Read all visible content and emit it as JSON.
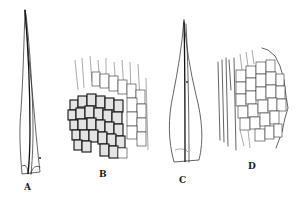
{
  "figure": {
    "type": "botanical line illustration",
    "background": "#ffffff",
    "ink_color": "#222222",
    "panels": [
      {
        "id": "A",
        "label": "A",
        "depicts": "narrow lanceolate leaf with long subulate tip and costa"
      },
      {
        "id": "B",
        "label": "B",
        "depicts": "leaf basal cells, areolation detail"
      },
      {
        "id": "C",
        "label": "C",
        "depicts": "lanceolate leaf with costa, broader base"
      },
      {
        "id": "D",
        "label": "D",
        "depicts": "leaf margin / basal cells, areolation detail"
      }
    ]
  }
}
